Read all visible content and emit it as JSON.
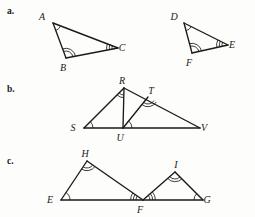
{
  "figure": {
    "background_color": "#fdfdfc",
    "ink_color": "#1a1a1a"
  },
  "parts": [
    {
      "id": "a",
      "marker": "a.",
      "figures": [
        {
          "name": "triangle-abc",
          "vertices": [
            {
              "label": "A",
              "x": 53,
              "y": 23,
              "arcs": 1,
              "label_dx": -11,
              "label_dy": -3
            },
            {
              "label": "B",
              "x": 66,
              "y": 58,
              "arcs": 2,
              "label_dx": -3,
              "label_dy": 13
            },
            {
              "label": "C",
              "x": 118,
              "y": 48,
              "arcs": 3,
              "label_dx": 4,
              "label_dy": 3
            }
          ]
        },
        {
          "name": "triangle-def",
          "vertices": [
            {
              "label": "D",
              "x": 184,
              "y": 23,
              "arcs": 1,
              "label_dx": -10,
              "label_dy": -3
            },
            {
              "label": "F",
              "x": 192,
              "y": 53,
              "arcs": 2,
              "label_dx": -3,
              "label_dy": 13
            },
            {
              "label": "E",
              "x": 228,
              "y": 45,
              "arcs": 3,
              "label_dx": 4,
              "label_dy": 3
            }
          ]
        }
      ]
    },
    {
      "id": "b",
      "marker": "b.",
      "figures": [
        {
          "name": "nested-triangles-srv",
          "vertices": [
            {
              "label": "S",
              "x": 84,
              "y": 128,
              "arcs": 1,
              "label_dx": -11,
              "label_dy": 3
            },
            {
              "label": "R",
              "x": 124,
              "y": 88,
              "arcs": 2,
              "label_dx": -2,
              "label_dy": -4
            },
            {
              "label": "U",
              "x": 123,
              "y": 128,
              "arcs": 1,
              "label_dx": -3,
              "label_dy": 13
            },
            {
              "label": "T",
              "x": 148,
              "y": 97,
              "arcs": 2,
              "label_dx": 3,
              "label_dy": -3
            },
            {
              "label": "V",
              "x": 200,
              "y": 128,
              "arcs": 0,
              "label_dx": 4,
              "label_dy": 3
            }
          ]
        }
      ]
    },
    {
      "id": "c",
      "marker": "c.",
      "figures": [
        {
          "name": "triangles-ehf-fig",
          "vertices": [
            {
              "label": "E",
              "x": 61,
              "y": 200,
              "arcs": 1,
              "label_dx": -11,
              "label_dy": 3
            },
            {
              "label": "H",
              "x": 87,
              "y": 161,
              "arcs": 2,
              "label_dx": -2,
              "label_dy": -4
            },
            {
              "label": "F",
              "x": 143,
              "y": 200,
              "arcs": 3,
              "label_dx": -3,
              "label_dy": 13
            },
            {
              "label": "I",
              "x": 175,
              "y": 172,
              "arcs": 2,
              "label_dx": 1,
              "label_dy": -4
            },
            {
              "label": "G",
              "x": 203,
              "y": 200,
              "arcs": 1,
              "label_dx": 4,
              "label_dy": 3
            }
          ]
        }
      ]
    }
  ]
}
